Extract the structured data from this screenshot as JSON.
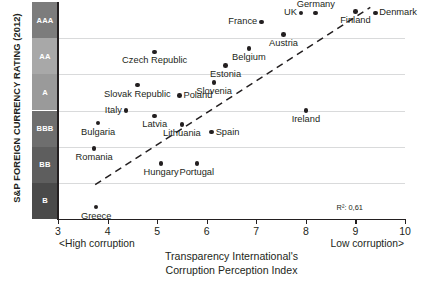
{
  "chart_data": {
    "type": "scatter",
    "title": "",
    "xlabel": "Transparency International's Corruption Perception Index",
    "ylabel": "S&P FOREIGN CURRENCY RATING (2012)",
    "xlim": [
      3,
      10
    ],
    "ylim": [
      0,
      6
    ],
    "xticks": [
      3,
      4,
      5,
      6,
      7,
      8,
      9,
      10
    ],
    "grid": true,
    "legend": null,
    "y_bands": [
      {
        "label": "AAA",
        "color": "#7c7c7c"
      },
      {
        "label": "AA",
        "color": "#a8a8a8"
      },
      {
        "label": "A",
        "color": "#9a9a9a"
      },
      {
        "label": "BBB",
        "color": "#6e6e6e"
      },
      {
        "label": "BB",
        "color": "#5e5e5e"
      },
      {
        "label": "B",
        "color": "#4a4a4a"
      }
    ],
    "annotations": {
      "r2": "R²: 0,61",
      "left_note": "<High corruption",
      "right_note": "Low corruption>"
    },
    "trendline": {
      "x0": 3.75,
      "y0": 0.95,
      "x1": 9.3,
      "y1": 5.85,
      "style": "dashed"
    },
    "points": [
      {
        "name": "Greece",
        "x": 3.77,
        "y": 0.33,
        "lx": "center",
        "ly": "below"
      },
      {
        "name": "Romania",
        "x": 3.73,
        "y": 1.95,
        "lx": "center",
        "ly": "below"
      },
      {
        "name": "Bulgaria",
        "x": 3.81,
        "y": 2.65,
        "lx": "center",
        "ly": "below"
      },
      {
        "name": "Hungary",
        "x": 5.08,
        "y": 1.53,
        "lx": "center",
        "ly": "below"
      },
      {
        "name": "Portugal",
        "x": 5.8,
        "y": 1.53,
        "lx": "center",
        "ly": "below"
      },
      {
        "name": "Spain",
        "x": 6.1,
        "y": 2.4,
        "lx": "right",
        "ly": "mid"
      },
      {
        "name": "Latvia",
        "x": 4.95,
        "y": 2.85,
        "lx": "center",
        "ly": "below"
      },
      {
        "name": "Lithuania",
        "x": 5.5,
        "y": 2.62,
        "lx": "center",
        "ly": "below"
      },
      {
        "name": "Italy",
        "x": 4.37,
        "y": 3.0,
        "lx": "left",
        "ly": "mid"
      },
      {
        "name": "Slovak Republic",
        "x": 4.6,
        "y": 3.7,
        "lx": "center",
        "ly": "below"
      },
      {
        "name": "Poland",
        "x": 5.45,
        "y": 3.42,
        "lx": "right",
        "ly": "mid"
      },
      {
        "name": "Ireland",
        "x": 8.0,
        "y": 3.0,
        "lx": "center",
        "ly": "below"
      },
      {
        "name": "Slovenia",
        "x": 6.15,
        "y": 3.78,
        "lx": "center",
        "ly": "below"
      },
      {
        "name": "Czech Republic",
        "x": 4.95,
        "y": 4.62,
        "lx": "center",
        "ly": "below"
      },
      {
        "name": "Estonia",
        "x": 6.38,
        "y": 4.25,
        "lx": "center",
        "ly": "below"
      },
      {
        "name": "Belgium",
        "x": 6.85,
        "y": 4.72,
        "lx": "center",
        "ly": "below"
      },
      {
        "name": "Austria",
        "x": 7.55,
        "y": 5.1,
        "lx": "center",
        "ly": "below"
      },
      {
        "name": "France",
        "x": 7.1,
        "y": 5.45,
        "lx": "left",
        "ly": "mid"
      },
      {
        "name": "UK",
        "x": 7.9,
        "y": 5.7,
        "lx": "left",
        "ly": "mid"
      },
      {
        "name": "Germany",
        "x": 8.2,
        "y": 5.7,
        "lx": "center",
        "ly": "above"
      },
      {
        "name": "Finland",
        "x": 9.0,
        "y": 5.73,
        "lx": "center",
        "ly": "below"
      },
      {
        "name": "Denmark",
        "x": 9.4,
        "y": 5.7,
        "lx": "right",
        "ly": "mid"
      }
    ]
  }
}
